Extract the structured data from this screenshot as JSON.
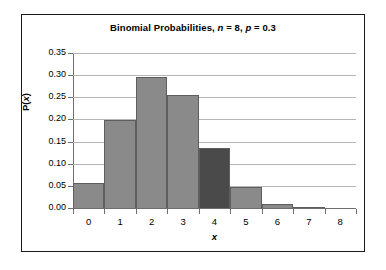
{
  "chart_data": {
    "type": "bar",
    "title": "Binomial Probabilities, n = 8, p = 0.3",
    "title_parts": {
      "prefix": "Binomial Probabilities, ",
      "n_symbol": "n",
      "n_value": " = 8, ",
      "p_symbol": "p",
      "p_value": " = 0.3"
    },
    "xlabel": "x",
    "ylabel": "P(x)",
    "ylabel_parts": {
      "prefix": "P(",
      "symbol": "x",
      "suffix": ")"
    },
    "categories": [
      "0",
      "1",
      "2",
      "3",
      "4",
      "5",
      "6",
      "7",
      "8"
    ],
    "values": [
      0.0576,
      0.1977,
      0.2965,
      0.2541,
      0.1361,
      0.0467,
      0.01,
      0.0012,
      0.0001
    ],
    "highlight_index": 4,
    "ylim": [
      0.0,
      0.35
    ],
    "ytick_step": 0.05,
    "ytick_labels": [
      "0.00",
      "0.05",
      "0.10",
      "0.15",
      "0.20",
      "0.25",
      "0.30",
      "0.35"
    ],
    "ytick_values": [
      0.0,
      0.05,
      0.1,
      0.15,
      0.2,
      0.25,
      0.3,
      0.35
    ],
    "xlim": [
      -0.5,
      8.5
    ],
    "grid": true,
    "legend": false,
    "colors": {
      "bar_fill": "#8a8a8a",
      "bar_highlight_fill": "#4a4a4a",
      "bar_edge": "#5e5e5e",
      "gridline": "#b5b5b5",
      "axis": "#6e6e6e",
      "frame": "#1a1a1a",
      "background": "#ffffff",
      "text": "#000000"
    }
  }
}
